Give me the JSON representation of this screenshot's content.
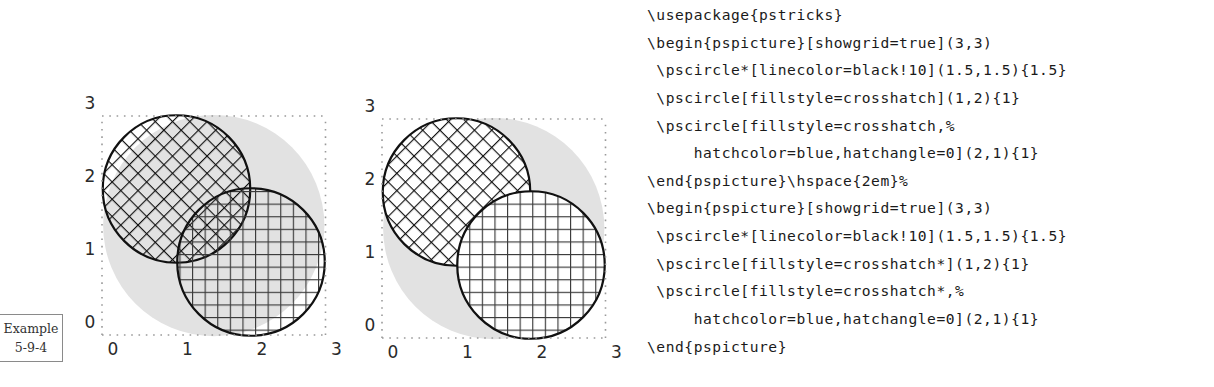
{
  "example_label": {
    "line1": "Example",
    "line2": "5-9-4"
  },
  "code_lines": [
    "\\usepackage{pstricks}",
    "\\begin{pspicture}[showgrid=true](3,3)",
    " \\pscircle*[linecolor=black!10](1.5,1.5){1.5}",
    " \\pscircle[fillstyle=crosshatch](1,2){1}",
    " \\pscircle[fillstyle=crosshatch,%",
    "     hatchcolor=blue,hatchangle=0](2,1){1}",
    "\\end{pspicture}\\hspace{2em}%",
    "\\begin{pspicture}[showgrid=true](3,3)",
    " \\pscircle*[linecolor=black!10](1.5,1.5){1.5}",
    " \\pscircle[fillstyle=crosshatch*](1,2){1}",
    " \\pscircle[fillstyle=crosshatch*,%",
    "     hatchcolor=blue,hatchangle=0](2,1){1}",
    "\\end{pspicture}"
  ],
  "colors": {
    "background_disk": "#e2e2e2",
    "hatch_default": "#111111",
    "hatch_blue_printed": "#3a3a3a",
    "outline": "#111111",
    "grid_dots": "#9a9a9a"
  },
  "figures": [
    {
      "id": "crosshatch",
      "grid": {
        "xrange": [
          0,
          3
        ],
        "yrange": [
          0,
          3
        ],
        "xticks": [
          "0",
          "1",
          "2",
          "3"
        ],
        "yticks": [
          "0",
          "1",
          "2",
          "3"
        ]
      },
      "circles": [
        {
          "role": "background-disk",
          "center": [
            1.5,
            1.5
          ],
          "radius": 1.5,
          "fill": "solid",
          "color": "black!10"
        },
        {
          "role": "circle-a",
          "center": [
            1,
            2
          ],
          "radius": 1,
          "fill": "crosshatch",
          "hatchangle": 45,
          "hatchcolor": "black",
          "opaque": false
        },
        {
          "role": "circle-b",
          "center": [
            2,
            1
          ],
          "radius": 1,
          "fill": "crosshatch",
          "hatchangle": 0,
          "hatchcolor": "blue",
          "opaque": false
        }
      ]
    },
    {
      "id": "crosshatch-star",
      "grid": {
        "xrange": [
          0,
          3
        ],
        "yrange": [
          0,
          3
        ],
        "xticks": [
          "0",
          "1",
          "2",
          "3"
        ],
        "yticks": [
          "0",
          "1",
          "2",
          "3"
        ]
      },
      "circles": [
        {
          "role": "background-disk",
          "center": [
            1.5,
            1.5
          ],
          "radius": 1.5,
          "fill": "solid",
          "color": "black!10"
        },
        {
          "role": "circle-a",
          "center": [
            1,
            2
          ],
          "radius": 1,
          "fill": "crosshatch*",
          "hatchangle": 45,
          "hatchcolor": "black",
          "opaque": true
        },
        {
          "role": "circle-b",
          "center": [
            2,
            1
          ],
          "radius": 1,
          "fill": "crosshatch*",
          "hatchangle": 0,
          "hatchcolor": "blue",
          "opaque": true
        }
      ]
    }
  ]
}
